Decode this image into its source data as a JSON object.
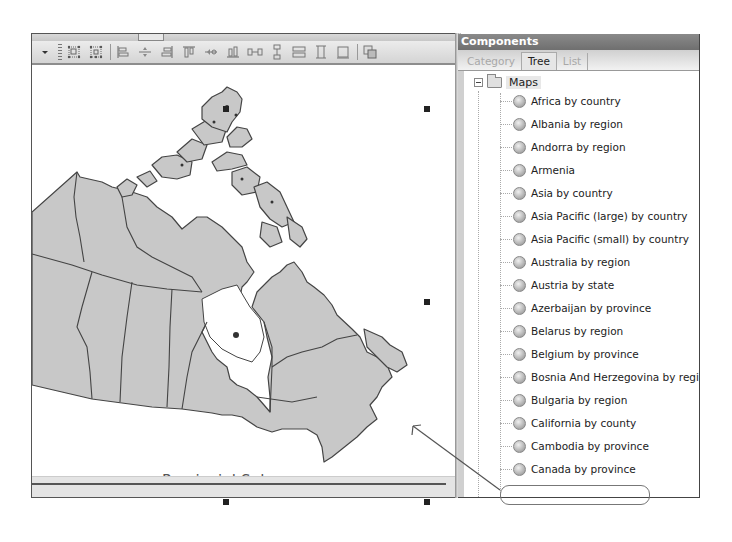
{
  "designer": {
    "toolbar": {
      "buttons": [
        {
          "name": "overflow-chevron",
          "icon": "chevron-down-icon"
        },
        {
          "name": "layout-grid-1",
          "icon": "layout-grid-icon"
        },
        {
          "name": "layout-grid-2",
          "icon": "layout-grid-alt-icon"
        },
        {
          "name": "align-left",
          "icon": "align-left-icon"
        },
        {
          "name": "align-center",
          "icon": "align-center-icon"
        },
        {
          "name": "align-right",
          "icon": "align-right-icon"
        },
        {
          "name": "align-top",
          "icon": "align-top-icon"
        },
        {
          "name": "align-middle",
          "icon": "align-middle-icon"
        },
        {
          "name": "align-bottom",
          "icon": "align-bottom-icon"
        },
        {
          "name": "space-horizontal",
          "icon": "space-horizontal-icon"
        },
        {
          "name": "space-vertical",
          "icon": "space-vertical-icon"
        },
        {
          "name": "same-width",
          "icon": "same-width-icon"
        },
        {
          "name": "same-height",
          "icon": "same-height-icon"
        },
        {
          "name": "same-size",
          "icon": "same-size-icon"
        },
        {
          "name": "bring-to-front",
          "icon": "bring-to-front-icon"
        }
      ]
    },
    "map": {
      "title": "Provincial Sales",
      "fill_color": "#c8c8c8",
      "border_color": "#444444"
    }
  },
  "components": {
    "title": "Components",
    "tabs": [
      {
        "label": "Category",
        "active": false
      },
      {
        "label": "Tree",
        "active": true
      },
      {
        "label": "List",
        "active": false
      }
    ],
    "tree": {
      "root": {
        "label": "Maps",
        "expanded": true
      },
      "items": [
        {
          "label": "Africa by country"
        },
        {
          "label": "Albania by region"
        },
        {
          "label": "Andorra by region"
        },
        {
          "label": "Armenia"
        },
        {
          "label": "Asia by country"
        },
        {
          "label": "Asia Pacific (large) by country"
        },
        {
          "label": "Asia Pacific (small) by country"
        },
        {
          "label": "Australia by region"
        },
        {
          "label": "Austria by state"
        },
        {
          "label": "Azerbaijan by province"
        },
        {
          "label": "Belarus by region"
        },
        {
          "label": "Belgium by province"
        },
        {
          "label": "Bosnia And Herzegovina by region"
        },
        {
          "label": "Bulgaria by region"
        },
        {
          "label": "California by county"
        },
        {
          "label": "Cambodia by province"
        },
        {
          "label": "Canada by province"
        }
      ],
      "highlighted": "Canada by province"
    }
  }
}
